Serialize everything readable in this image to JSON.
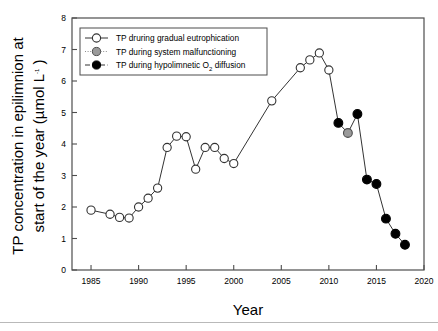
{
  "figure": {
    "axis_title_x": "Year",
    "axis_title_y_line1": "TP concentration in epilimnion at",
    "axis_title_y_line2_pre": "start of the year (",
    "axis_title_y_mu": "µmol L",
    "axis_title_y_sup": "-1",
    "axis_title_y_post": " )"
  },
  "legend": {
    "items": [
      {
        "label": "TP druring gradual eutrophication",
        "marker": "open-circle-marker",
        "fill": "#ffffff",
        "line": "solid"
      },
      {
        "label": "TP during system malfunctioning",
        "marker": "gray-circle-marker",
        "fill": "#9a9a9a",
        "line": "dotted"
      },
      {
        "label_pre": "TP during hypolimnetic O",
        "label_sub": "2",
        "label_post": " diffusion",
        "label": "TP during hypolimnetic O2 diffusion",
        "marker": "black-circle-marker",
        "fill": "#000000",
        "line": "dashed"
      }
    ]
  },
  "colors": {
    "open": "#ffffff",
    "gray": "#9a9a9a",
    "black": "#000000",
    "stroke": "#333333",
    "axis": "#4d4d4d"
  },
  "chart_data": {
    "type": "line",
    "title": "",
    "xlabel": "Year",
    "ylabel": "TP concentration in epilimnion at start of the year (µmol L-1)",
    "xlim": [
      1983,
      2020
    ],
    "ylim": [
      0,
      8
    ],
    "xticks": [
      1985,
      1990,
      1995,
      2000,
      2005,
      2010,
      2015,
      2020
    ],
    "yticks": [
      0,
      1,
      2,
      3,
      4,
      5,
      6,
      7,
      8
    ],
    "grid": false,
    "legend_position": "top-left",
    "series": [
      {
        "name": "TP druring gradual eutrophication",
        "marker": "open-circle",
        "color": "#ffffff",
        "x": [
          1985,
          1987,
          1988,
          1989,
          1990,
          1991,
          1992,
          1993,
          1994,
          1995,
          1996,
          1997,
          1998,
          1999,
          2000,
          2004,
          2007,
          2008,
          2009,
          2010
        ],
        "values": [
          1.9,
          1.77,
          1.67,
          1.65,
          2.0,
          2.28,
          2.6,
          3.89,
          4.25,
          4.23,
          3.2,
          3.89,
          3.89,
          3.54,
          3.38,
          5.37,
          6.42,
          6.67,
          6.89,
          6.35
        ]
      },
      {
        "name": "TP during system malfunctioning",
        "marker": "gray-circle",
        "color": "#9a9a9a",
        "x": [
          2012
        ],
        "values": [
          4.35
        ]
      },
      {
        "name": "TP during hypolimnetic O2 diffusion",
        "marker": "black-circle",
        "color": "#000000",
        "x": [
          2011,
          2013,
          2014,
          2015,
          2016,
          2017,
          2018
        ],
        "values": [
          4.67,
          4.95,
          2.87,
          2.73,
          1.63,
          1.15,
          0.8
        ]
      }
    ],
    "connected_path": {
      "x": [
        1985,
        1987,
        1988,
        1989,
        1990,
        1991,
        1992,
        1993,
        1994,
        1995,
        1996,
        1997,
        1998,
        1999,
        2000,
        2004,
        2007,
        2008,
        2009,
        2010,
        2011,
        2012,
        2013,
        2014,
        2015,
        2016,
        2017,
        2018
      ],
      "values": [
        1.9,
        1.77,
        1.67,
        1.65,
        2.0,
        2.28,
        2.6,
        3.89,
        4.25,
        4.23,
        3.2,
        3.89,
        3.89,
        3.54,
        3.38,
        5.37,
        6.42,
        6.67,
        6.89,
        6.35,
        4.67,
        4.35,
        4.95,
        2.87,
        2.73,
        1.63,
        1.15,
        0.8
      ]
    }
  }
}
